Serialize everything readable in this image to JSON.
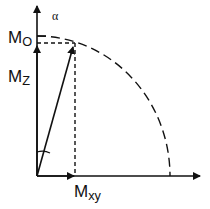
{
  "diagram": {
    "type": "vector-decomposition",
    "labels": {
      "alpha": "α",
      "m_o_main": "M",
      "m_o_sub": "O",
      "m_z_main": "M",
      "m_z_sub": "Z",
      "m_xy_main": "M",
      "m_xy_sub": "xy"
    },
    "colors": {
      "stroke": "#111111",
      "background": "#ffffff"
    }
  }
}
